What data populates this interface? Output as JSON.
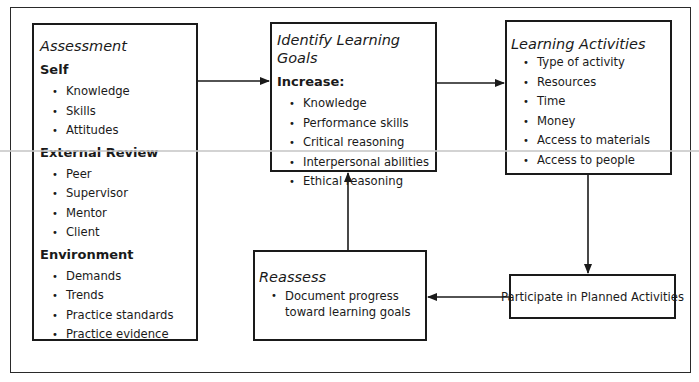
{
  "diagram": {
    "assessment": {
      "title": "Assessment",
      "sections": [
        {
          "heading": "Self",
          "items": [
            "Knowledge",
            "Skills",
            "Attitudes"
          ]
        },
        {
          "heading": "External Review",
          "items": [
            "Peer",
            "Supervisor",
            "Mentor",
            "Client"
          ]
        },
        {
          "heading": "Environment",
          "items": [
            "Demands",
            "Trends",
            "Practice standards",
            "Practice evidence"
          ]
        }
      ]
    },
    "goals": {
      "title": "Identify Learning Goals",
      "heading": "Increase:",
      "items": [
        "Knowledge",
        "Performance skills",
        "Critical reasoning",
        "Interpersonal abilities",
        "Ethical reasoning"
      ]
    },
    "activities": {
      "title": "Learning Activities",
      "items": [
        "Type of activity",
        "Resources",
        "Time",
        "Money",
        "Access to materials",
        "Access to people"
      ]
    },
    "reassess": {
      "title": "Reassess",
      "items": [
        "Document progress toward learning goals"
      ]
    },
    "participate": {
      "label": "Participate in Planned Activities"
    },
    "flow": [
      {
        "from": "Assessment",
        "to": "Identify Learning Goals"
      },
      {
        "from": "Identify Learning Goals",
        "to": "Learning Activities"
      },
      {
        "from": "Learning Activities",
        "to": "Participate in Planned Activities"
      },
      {
        "from": "Participate in Planned Activities",
        "to": "Reassess"
      },
      {
        "from": "Reassess",
        "to": "Identify Learning Goals"
      }
    ],
    "colors": {
      "line": "#1a1a1a",
      "background": "#ffffff"
    }
  }
}
